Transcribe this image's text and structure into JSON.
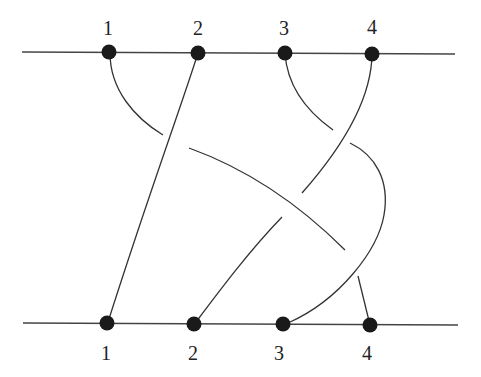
{
  "diagram": {
    "type": "braid",
    "strand_count": 4,
    "top_labels": [
      "1",
      "2",
      "3",
      "4"
    ],
    "bottom_labels": [
      "1",
      "2",
      "3",
      "4"
    ],
    "colors": {
      "line": "#333333",
      "node": "#1a1a1a",
      "background": "#ffffff"
    },
    "permutation": {
      "top_1": "bottom_4",
      "top_2": "bottom_1",
      "top_3": "bottom_3",
      "top_4": "bottom_2"
    }
  }
}
